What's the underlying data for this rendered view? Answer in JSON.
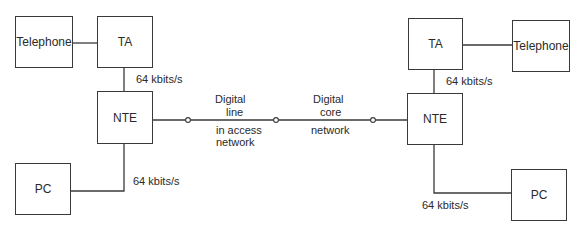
{
  "diagram": {
    "left": {
      "telephone": "Telephone",
      "ta": "TA",
      "nte": "NTE",
      "pc": "PC",
      "rate_ta_nte": "64 kbits/s",
      "rate_nte_pc": "64 kbits/s"
    },
    "middle": {
      "access_top_1": "Digital",
      "access_top_2": "line",
      "access_bottom_1": "in access",
      "access_bottom_2": "network",
      "core_top_1": "Digital",
      "core_top_2": "core",
      "core_bottom": "network"
    },
    "right": {
      "telephone": "Telephone",
      "ta": "TA",
      "nte": "NTE",
      "pc": "PC",
      "rate_ta_nte": "64 kbits/s",
      "rate_nte_pc": "64 kbits/s"
    },
    "colors": {
      "line": "#3a3a3a",
      "text": "#2a2a2a",
      "background": "#ffffff"
    }
  }
}
